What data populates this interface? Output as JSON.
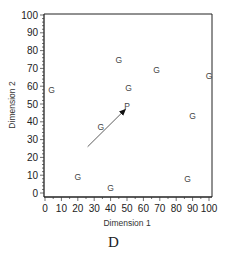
{
  "chart_data": {
    "type": "scatter",
    "title": "",
    "caption": "D",
    "xlabel": "Dimension 1",
    "ylabel": "Dimension 2",
    "xlim": [
      0,
      100
    ],
    "ylim": [
      0,
      100
    ],
    "x_ticks": [
      0,
      10,
      20,
      30,
      40,
      50,
      60,
      70,
      80,
      90,
      100
    ],
    "y_ticks": [
      0,
      10,
      20,
      30,
      40,
      50,
      60,
      70,
      80,
      90,
      100
    ],
    "grid": false,
    "legend": null,
    "series": [
      {
        "name": "G",
        "marker_label": "G",
        "points": [
          {
            "x": 4,
            "y": 58
          },
          {
            "x": 45,
            "y": 75
          },
          {
            "x": 51,
            "y": 59
          },
          {
            "x": 68,
            "y": 69
          },
          {
            "x": 100,
            "y": 66
          },
          {
            "x": 34,
            "y": 37
          },
          {
            "x": 90,
            "y": 43
          },
          {
            "x": 20,
            "y": 9
          },
          {
            "x": 40,
            "y": 3
          },
          {
            "x": 87,
            "y": 8
          }
        ]
      },
      {
        "name": "P",
        "marker_label": "P",
        "points": [
          {
            "x": 50,
            "y": 49
          }
        ]
      }
    ],
    "annotations": [
      {
        "type": "arrow",
        "from": {
          "x": 26,
          "y": 26
        },
        "to": {
          "x": 49,
          "y": 47
        }
      }
    ]
  }
}
